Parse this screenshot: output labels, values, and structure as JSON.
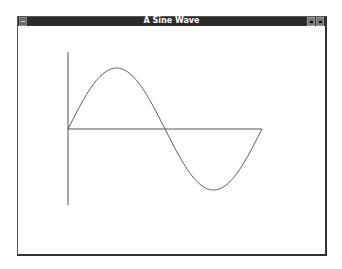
{
  "window": {
    "title": "A Sine Wave",
    "controls": {
      "system_menu": "system-menu-icon",
      "minimize": "minimize-icon",
      "maximize": "maximize-icon"
    }
  },
  "plot": {
    "type": "line",
    "function": "sin(x)",
    "x_range": [
      0,
      6.283
    ],
    "y_range": [
      -1,
      1
    ],
    "axis_color": "#555555",
    "curve_color": "#555555",
    "periods": 1
  }
}
